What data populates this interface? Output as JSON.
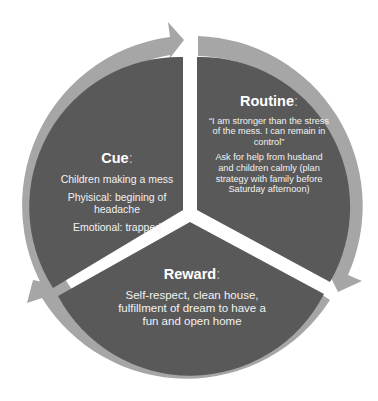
{
  "diagram": {
    "type": "habit-loop-cycle",
    "colors": {
      "ring": "#a6a6a6",
      "segment": "#595959",
      "divider": "#ffffff",
      "text": "#f2f2f2",
      "background": "#ffffff"
    },
    "segments": [
      {
        "id": "cue",
        "title": "Cue",
        "colon": ":",
        "lines": [
          "Children making a mess",
          "Phyisical: begining of headache",
          "Emotional: trapped"
        ]
      },
      {
        "id": "routine",
        "title": "Routine",
        "colon": ":",
        "lines": [
          "“I am stronger than the stress of the mess. I can remain in control”",
          "Ask for help from husband and children calmly (plan strategy with family before Saturday afternoon)"
        ]
      },
      {
        "id": "reward",
        "title": "Reward",
        "colon": ":",
        "lines": [
          "Self-respect, clean house, fulfillment of dream to have a fun and open home"
        ]
      }
    ],
    "arrows": [
      {
        "name": "arrow-cue-to-routine",
        "direction": "clockwise"
      },
      {
        "name": "arrow-routine-to-reward",
        "direction": "clockwise"
      },
      {
        "name": "arrow-reward-to-cue",
        "direction": "clockwise"
      }
    ]
  }
}
